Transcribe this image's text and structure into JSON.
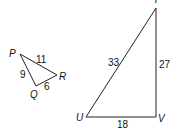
{
  "figure": {
    "small_triangle": {
      "vertices": {
        "P": "P",
        "Q": "Q",
        "R": "R"
      },
      "sides": {
        "PR": "11",
        "PQ": "9",
        "QR": "6"
      }
    },
    "large_triangle": {
      "vertices": {
        "T": "T",
        "U": "U",
        "V": "V"
      },
      "sides": {
        "TU": "33",
        "TV": "27",
        "UV": "18"
      }
    }
  }
}
